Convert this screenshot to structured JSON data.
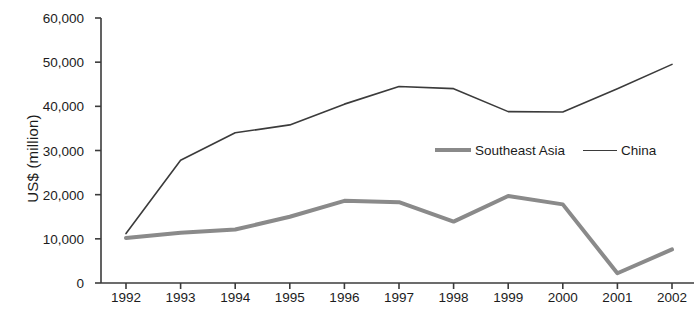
{
  "chart_data": {
    "type": "line",
    "title": "",
    "xlabel": "",
    "ylabel": "US$ (million)",
    "categories": [
      "1992",
      "1993",
      "1994",
      "1995",
      "1996",
      "1997",
      "1998",
      "1999",
      "2000",
      "2001",
      "2002"
    ],
    "ylim": [
      0,
      60000
    ],
    "ytick_labels": [
      "60,000",
      "50,000",
      "40,000",
      "30,000",
      "20,000",
      "10,000",
      "0"
    ],
    "ytick_values": [
      60000,
      50000,
      40000,
      30000,
      20000,
      10000,
      0
    ],
    "grid": false,
    "legend_position": "middle-right-inside",
    "series": [
      {
        "name": "Southeast Asia",
        "color": "#8a8a8a",
        "line_width": 4,
        "values": [
          10200,
          11400,
          12100,
          15000,
          18600,
          18300,
          13900,
          19700,
          17800,
          2200,
          7600
        ]
      },
      {
        "name": "China",
        "color": "#3b3b3b",
        "line_width": 1.6,
        "values": [
          11200,
          27800,
          34000,
          35800,
          40500,
          44500,
          44000,
          38800,
          38700,
          44000,
          49500
        ]
      }
    ]
  },
  "legend": {
    "items": [
      {
        "label": "Southeast Asia",
        "style": "thick"
      },
      {
        "label": "China",
        "style": "thin"
      }
    ]
  },
  "axis": {
    "y_label": "US$ (million)",
    "axis_color": "#3b3b3b"
  }
}
